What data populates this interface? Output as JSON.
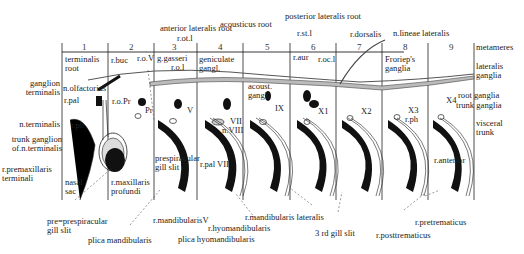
{
  "figure": {
    "metameres_label": "metameres",
    "metamere_numbers": [
      "1",
      "2",
      "3",
      "4",
      "5",
      "6",
      "7",
      "8",
      "9"
    ],
    "labels": {
      "anterior_lateralis_root": "anterior lateralis root",
      "acousticus_root": "acousticus root",
      "posterior_lateralis_root": "posterior lateralis root",
      "r_dorsalis": "r.dorsalis",
      "n_lineae_lateralis": "n.lineae lateralis",
      "r_ot_l": "r.ot.l",
      "r_st_l": "r.st.l",
      "terminalis_root_1": "terminalis",
      "terminalis_root_2": "root",
      "r_buc": "r.buc",
      "r_o_V": "r.o.V",
      "g_gasseri": "g.gasseri",
      "r_o_l": "r.o.l",
      "geniculate_1": "geniculate",
      "geniculate_2": "gangl.",
      "r_aur": "r.aur",
      "r_oc_l": "r.oc.l",
      "froriep_1": "Froriep's",
      "froriep_2": "ganglia",
      "lateralis_ganglia_1": "lateralis",
      "lateralis_ganglia_2": "ganglia",
      "ganglion_terminalis_1": "ganglion",
      "ganglion_terminalis_2": "terminalis",
      "n_olfactorius": "n.olfactorius",
      "r_pal": "r.pal",
      "r_o_Pr": "r.o.Pr",
      "Pr": "Pr",
      "V": "V",
      "VII": "VII",
      "n_VIII": "n.VIII",
      "acoust_gangl_1": "acoust.",
      "acoust_gangl_2": "gangl.",
      "IX": "IX",
      "X1": "X1",
      "X2": "X2",
      "X3": "X3",
      "X3_r_ph": "r.ph",
      "X4": "X4",
      "root_ganglia_1": "root",
      "root_ganglia_2": "ganglia",
      "trunk_ganglia_1": "trunk",
      "trunk_ganglia_2": "ganglia",
      "visceral_trunk_1": "visceral",
      "visceral_trunk_2": "trunk",
      "n_terminalis": "n.terminalis",
      "r_ph": "r.ph",
      "trunk_ganglion_1": "trunk ganglion",
      "trunk_ganglion_2": "of.n.terminalis",
      "r_premax_1": "r.premaxillaris",
      "r_premax_2": "terminali",
      "nasal_sac_1": "nasal",
      "nasal_sac_2": "sac",
      "r_max_prof_1": "r.maxillaris",
      "r_max_prof_2": "profundi",
      "prespir_gill_1": "prespiracular",
      "prespir_gill_2": "gill slit",
      "r_pal_VII": "r.pal VII",
      "r_anterior": "r.anterior",
      "pre_prespir_1": "pre=prespiracular",
      "pre_prespir_2": "gill slit",
      "plica_mandibularis": "plica  mandibularis",
      "r_mandibularis_V": "r.mandibularisV",
      "r_hyomandibularis": "r.hyomandibularis",
      "plica_hyomandibularis": "plica hyomandibularis",
      "r_mandibularis_lateralis": "r.mandibularis lateralis",
      "third_gill_slit": "3 rd  gill slit",
      "r_pretrematicus": "r.pretrematicus",
      "r_posttrematicus": "r.posttrematicus"
    }
  }
}
